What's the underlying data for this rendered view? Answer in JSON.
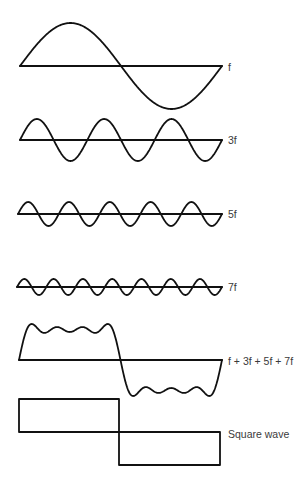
{
  "diagram": {
    "stroke_color": "#111111",
    "label_color": "#3a3a3a",
    "background": "#ffffff",
    "waves": [
      {
        "id": "f",
        "label": "f",
        "harmonic": 1,
        "baseline_y": 66,
        "x_start": 20,
        "x_end": 222,
        "amplitude": 43,
        "stroke_width": 1.8,
        "label_x": 228,
        "label_y": 62
      },
      {
        "id": "3f",
        "label": "3f",
        "harmonic": 3,
        "baseline_y": 140,
        "x_start": 20,
        "x_end": 222,
        "amplitude": 21,
        "stroke_width": 1.8,
        "label_x": 228,
        "label_y": 135
      },
      {
        "id": "5f",
        "label": "5f",
        "harmonic": 5,
        "baseline_y": 214,
        "x_start": 18,
        "x_end": 222,
        "amplitude": 12,
        "stroke_width": 1.8,
        "label_x": 228,
        "label_y": 209
      },
      {
        "id": "7f",
        "label": "7f",
        "harmonic": 7,
        "baseline_y": 287,
        "x_start": 17,
        "x_end": 222,
        "amplitude": 8,
        "stroke_width": 1.8,
        "label_x": 228,
        "label_y": 282
      },
      {
        "id": "sum",
        "label": "f + 3f + 5f + 7f",
        "harmonics": [
          1,
          3,
          5,
          7
        ],
        "baseline_y": 360,
        "x_start": 19,
        "x_end": 222,
        "amplitude": 36,
        "stroke_width": 1.8,
        "label_x": 228,
        "label_y": 356
      }
    ],
    "square_wave": {
      "label": "Square wave",
      "x_start": 19,
      "x_mid": 119,
      "x_end": 220,
      "top_y": 399,
      "baseline_y": 432,
      "bottom_y": 465,
      "stroke_width": 1.8,
      "label_x": 228,
      "label_y": 429
    }
  }
}
